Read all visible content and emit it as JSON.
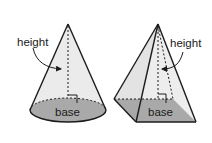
{
  "figures": [
    {
      "name": "cone",
      "labels": {
        "height": "height",
        "base": "base"
      }
    },
    {
      "name": "pyramid",
      "labels": {
        "height": "height",
        "base": "base"
      }
    }
  ],
  "colors": {
    "side_fill": "#ebebeb",
    "base_fill": "#a9a9a9",
    "stroke": "#1c1c1c",
    "background": "#ffffff"
  }
}
